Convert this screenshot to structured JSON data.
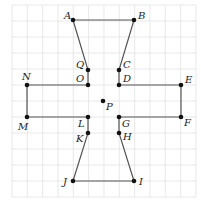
{
  "diagram": {
    "type": "grid-polygon",
    "grid": {
      "x_start": 12,
      "y_start": 5,
      "cols": 12,
      "rows": 12,
      "dx": 15.33,
      "dy": 16,
      "color": "#e2e2e2"
    },
    "style": {
      "edge_color": "#555555",
      "point_color": "#111111"
    },
    "points": {
      "A": {
        "x": 73,
        "y": 20,
        "label": "A",
        "lx": 64,
        "ly": 19
      },
      "B": {
        "x": 134,
        "y": 20,
        "label": "B",
        "lx": 138,
        "ly": 19
      },
      "C": {
        "x": 119,
        "y": 70,
        "label": "C",
        "lx": 123,
        "ly": 68
      },
      "D": {
        "x": 119,
        "y": 85,
        "label": "D",
        "lx": 123,
        "ly": 82
      },
      "E": {
        "x": 181,
        "y": 85,
        "label": "E",
        "lx": 185,
        "ly": 83
      },
      "F": {
        "x": 181,
        "y": 117,
        "label": "F",
        "lx": 184,
        "ly": 126
      },
      "G": {
        "x": 119,
        "y": 117,
        "label": "G",
        "lx": 122,
        "ly": 127
      },
      "H": {
        "x": 119,
        "y": 133,
        "label": "H",
        "lx": 123,
        "ly": 140
      },
      "I": {
        "x": 134,
        "y": 181,
        "label": "I",
        "lx": 139,
        "ly": 185
      },
      "J": {
        "x": 73,
        "y": 181,
        "label": "J",
        "lx": 63,
        "ly": 185
      },
      "K": {
        "x": 88,
        "y": 133,
        "label": "K",
        "lx": 76,
        "ly": 142
      },
      "L": {
        "x": 88,
        "y": 117,
        "label": "L",
        "lx": 78,
        "ly": 127
      },
      "M": {
        "x": 27,
        "y": 117,
        "label": "M",
        "lx": 18,
        "ly": 130
      },
      "N": {
        "x": 27,
        "y": 85,
        "label": "N",
        "lx": 22,
        "ly": 80
      },
      "O": {
        "x": 88,
        "y": 85,
        "label": "O",
        "lx": 76,
        "ly": 82
      },
      "Q": {
        "x": 88,
        "y": 70,
        "label": "Q",
        "lx": 76,
        "ly": 68
      },
      "P": {
        "x": 103,
        "y": 101,
        "label": "P",
        "lx": 106,
        "ly": 110
      }
    },
    "polygon_order": [
      "A",
      "B",
      "C",
      "D",
      "E",
      "F",
      "G",
      "H",
      "I",
      "J",
      "K",
      "L",
      "M",
      "N",
      "O",
      "Q"
    ],
    "isolated_points": [
      "P"
    ]
  }
}
